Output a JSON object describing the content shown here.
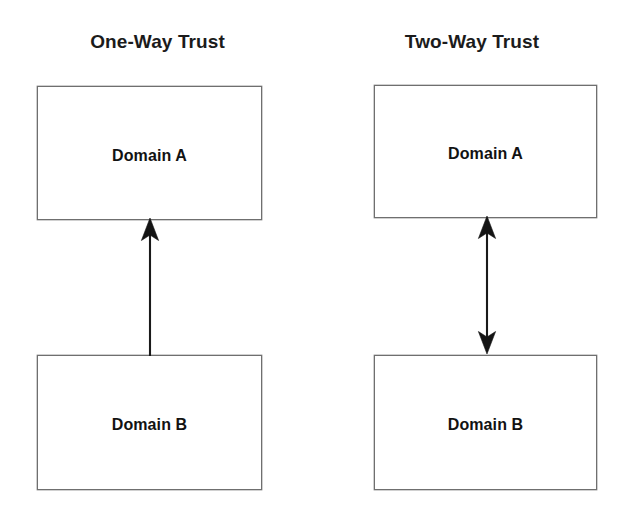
{
  "diagram": {
    "background_color": "#ffffff",
    "line_color": "#1a1a1a",
    "box_border_color": "#6f6f6f",
    "text_color": "#121212",
    "panels": [
      {
        "id": "one-way",
        "title": "One-Way Trust",
        "top_node": "Domain A",
        "bottom_node": "Domain B",
        "arrow_type": "single-headed",
        "arrow_direction": "up",
        "arrow_description": "Domain B trusts Domain A"
      },
      {
        "id": "two-way",
        "title": "Two-Way Trust",
        "top_node": "Domain A",
        "bottom_node": "Domain B",
        "arrow_type": "double-headed",
        "arrow_direction": "up-and-down",
        "arrow_description": "Domain A and Domain B trust each other"
      }
    ]
  }
}
